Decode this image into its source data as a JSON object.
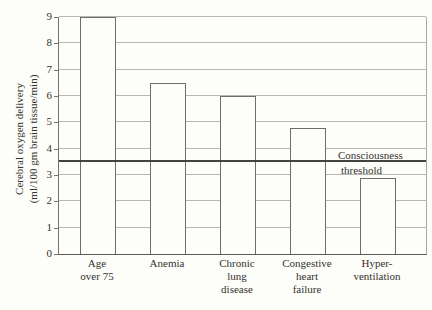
{
  "figure": {
    "background": "#fdfdfa",
    "text_color": "#34332c"
  },
  "chart_data": {
    "type": "bar",
    "title": "",
    "categories": [
      "Age over 75",
      "Anemia",
      "Chronic lung disease",
      "Congestive heart failure",
      "Hyper-ventilation"
    ],
    "categories_lines": [
      [
        "Age",
        "over 75"
      ],
      [
        "Anemia"
      ],
      [
        "Chronic",
        "lung",
        "disease"
      ],
      [
        "Congestive",
        "heart",
        "failure"
      ],
      [
        "Hyper-",
        "ventilation"
      ]
    ],
    "values": [
      9.0,
      6.5,
      6.0,
      4.8,
      2.9
    ],
    "xlabel": "",
    "ylabel": "Cerebral oxygen delivery (ml/100 gm brain tissue/min)",
    "ylabel_lines": [
      "Cerebral oxygen delivery",
      "(ml/100 gm brain tissue/min)"
    ],
    "ylim": [
      0,
      9
    ],
    "yticks": [
      0,
      1,
      2,
      3,
      4,
      5,
      6,
      7,
      8,
      9
    ],
    "grid": "horizontal",
    "legend": "none",
    "grid_color": "#b8b7b0",
    "bar_fill": "#fdfdfa",
    "bar_border": "#6f6d65",
    "threshold": {
      "value": 3.5,
      "label_lines": [
        "Consciousness",
        "threshold"
      ],
      "color": "#45443c"
    }
  }
}
